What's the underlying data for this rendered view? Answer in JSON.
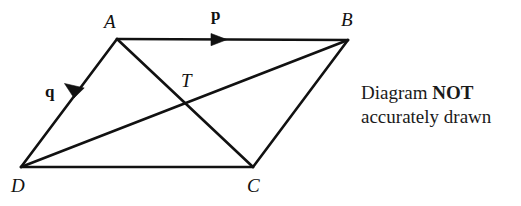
{
  "canvas": {
    "width": 521,
    "height": 206,
    "background": "#ffffff",
    "stroke_color": "#111111",
    "stroke_width": 2.6
  },
  "figure": {
    "type": "parallelogram-with-diagonals",
    "vertices": [
      {
        "name": "A",
        "label": "A",
        "x": 117,
        "y": 39,
        "label_x": 104,
        "label_y": 12
      },
      {
        "name": "B",
        "label": "B",
        "x": 348,
        "y": 40,
        "label_x": 341,
        "label_y": 10
      },
      {
        "name": "C",
        "label": "C",
        "x": 253,
        "y": 167,
        "label_x": 247,
        "label_y": 176
      },
      {
        "name": "D",
        "label": "D",
        "x": 21,
        "y": 167,
        "label_x": 11,
        "label_y": 176
      }
    ],
    "intersection": {
      "name": "T",
      "label": "T",
      "x": 186,
      "y": 104,
      "label_x": 181,
      "label_y": 71
    },
    "edges": [
      {
        "from": "A",
        "to": "B"
      },
      {
        "from": "B",
        "to": "C"
      },
      {
        "from": "C",
        "to": "D"
      },
      {
        "from": "D",
        "to": "A"
      }
    ],
    "diagonals": [
      {
        "from": "A",
        "to": "C"
      },
      {
        "from": "D",
        "to": "B"
      }
    ]
  },
  "vectors": [
    {
      "name": "p",
      "label": "p",
      "on_edge": "A-B",
      "direction": "A-to-B",
      "label_x": 211,
      "label_y": 6,
      "arrow_tip_x": 227,
      "arrow_tip_y": 39.6,
      "arrow_angle_deg": 0.25
    },
    {
      "name": "q",
      "label": "q",
      "on_edge": "A-D",
      "direction": "A-to-D",
      "label_x": 45,
      "label_y": 83,
      "arrow_tip_x": 74,
      "arrow_tip_y": 98,
      "arrow_angle_deg": 128.0
    }
  ],
  "note": {
    "line1_prefix": "Diagram ",
    "line1_emphasis": "NOT",
    "line2": "accurately drawn"
  }
}
